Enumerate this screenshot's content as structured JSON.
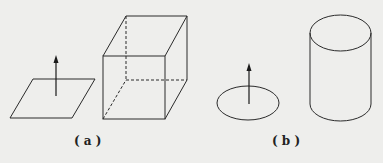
{
  "figure": {
    "background": "#eeeeec",
    "stroke_color": "#2a2a2a",
    "panels": [
      {
        "label": "( a )",
        "shapes": [
          "flat square surface with normal vector arrow",
          "cube (closed surface) with dashed hidden edges"
        ]
      },
      {
        "label": "( b )",
        "shapes": [
          "flat circular (elliptical) surface with normal vector arrow",
          "cylinder (closed surface)"
        ]
      }
    ]
  }
}
